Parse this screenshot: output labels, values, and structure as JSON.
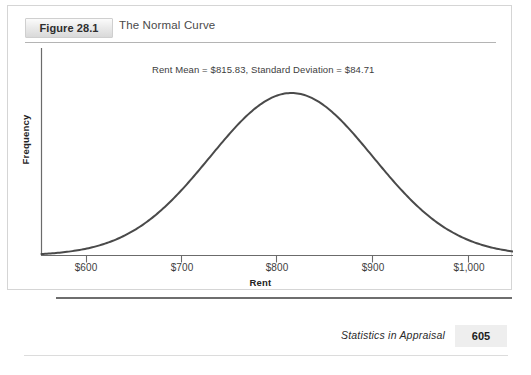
{
  "figure": {
    "number_label": "Figure 28.1",
    "title": "The Normal Curve"
  },
  "footer": {
    "book_title": "Statistics in Appraisal",
    "page_number": "605"
  },
  "colors": {
    "curve": "#4a4a4a",
    "axis": "#6b6b6b",
    "badge_text": "#2e2e2e",
    "title_text": "#4a4a4a",
    "rule": "#b4b4b4",
    "footer_rule": "#6e6e6e",
    "page_number_background": "#eeeeee"
  },
  "chart_data": {
    "type": "line",
    "title": "The Normal Curve",
    "subtitle": "",
    "annotation": "Rent Mean =  $815.83, Standard Deviation = $84.71",
    "annotations": [
      {
        "text": "Rent Mean =  $815.83, Standard Deviation = $84.71",
        "x": 815.83,
        "position": "above-peak"
      }
    ],
    "xlabel": "Rent",
    "ylabel": "Frequency",
    "distribution": "normal",
    "mean": 815.83,
    "std_dev": 84.71,
    "xlim": [
      556,
      1046
    ],
    "ylim": [
      0,
      1
    ],
    "xticks": [
      600,
      700,
      800,
      900,
      1000
    ],
    "xtick_labels": [
      "$600",
      "$700",
      "$800",
      "$900",
      "$1,000"
    ],
    "yticks": [],
    "ytick_labels": [],
    "grid": false,
    "legend": false,
    "legend_position": "none",
    "series": [
      {
        "name": "Rent distribution",
        "x": [
          556,
          576,
          596,
          616,
          636,
          656,
          676,
          696,
          716,
          736,
          756,
          776,
          796,
          816,
          836,
          856,
          876,
          896,
          916,
          936,
          956,
          976,
          996,
          1016,
          1036,
          1046
        ],
        "y": [
          0.013,
          0.022,
          0.036,
          0.056,
          0.085,
          0.123,
          0.174,
          0.236,
          0.31,
          0.394,
          0.484,
          0.575,
          0.66,
          0.735,
          0.791,
          0.826,
          0.836,
          0.821,
          0.782,
          0.722,
          0.647,
          0.563,
          0.476,
          0.391,
          0.312,
          0.276
        ]
      }
    ]
  }
}
